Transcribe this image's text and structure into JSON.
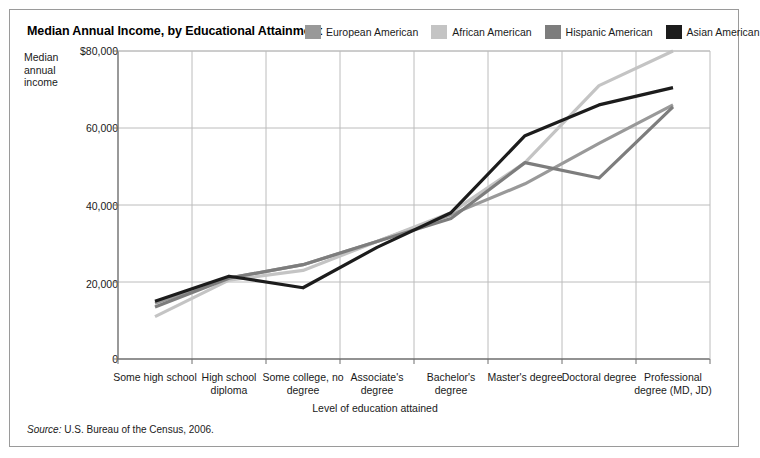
{
  "figure": {
    "title": "Median Annual Income, by Educational Attainment",
    "source_keyword": "Source:",
    "source_text": " U.S. Bureau of the Census, 2006."
  },
  "legend": {
    "position": "top-right",
    "items": [
      {
        "label": "European American",
        "color": "#999999"
      },
      {
        "label": "African American",
        "color": "#c4c4c4"
      },
      {
        "label": "Hispanic American",
        "color": "#7d7d7d"
      },
      {
        "label": "Asian American",
        "color": "#1c1c1c"
      }
    ]
  },
  "axes": {
    "ylabel": "Median annual income",
    "xlabel": "Level of education attained",
    "yticks": [
      "$80,000",
      "60,000",
      "40,000",
      "20,000",
      "0"
    ],
    "ytick_values": [
      80000,
      60000,
      40000,
      20000,
      0
    ]
  },
  "chart_data": {
    "type": "line",
    "title": "Median Annual Income, by Educational Attainment",
    "xlabel": "Level of education attained",
    "ylabel": "Median annual income",
    "ylim": [
      0,
      80000
    ],
    "yticks": [
      0,
      20000,
      40000,
      60000,
      80000
    ],
    "grid": true,
    "legend_position": "top-right",
    "categories": [
      "Some high school",
      "High school diploma",
      "Some college, no degree",
      "Associate's degree",
      "Bachelor's degree",
      "Master's degree",
      "Doctoral degree",
      "Professional degree (MD, JD)"
    ],
    "series": [
      {
        "name": "European American",
        "color": "#999999",
        "values": [
          14500,
          21000,
          24500,
          30500,
          37500,
          45500,
          56000,
          66000
        ]
      },
      {
        "name": "African American",
        "color": "#c4c4c4",
        "values": [
          11000,
          20500,
          23000,
          30500,
          38000,
          51000,
          71000,
          80000
        ]
      },
      {
        "name": "Hispanic American",
        "color": "#7d7d7d",
        "values": [
          13500,
          21000,
          24500,
          30500,
          36500,
          51000,
          47000,
          65500
        ]
      },
      {
        "name": "Asian American",
        "color": "#1c1c1c",
        "values": [
          15000,
          21500,
          18500,
          29000,
          38000,
          58000,
          66000,
          70500
        ]
      }
    ]
  }
}
